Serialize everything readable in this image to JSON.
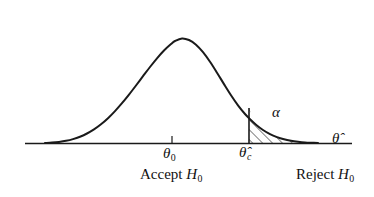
{
  "figure": {
    "name": "hypothesis-test-normal-curve",
    "background_color": "#ffffff",
    "ink_color": "#111111"
  },
  "labels": {
    "theta_null": "θ",
    "theta_null_sub": "0",
    "theta_crit": "θ̂",
    "theta_crit_sub": "c",
    "axis": "θ̂",
    "alpha": "α",
    "accept_text": "Accept ",
    "accept_h": "H",
    "accept_sub": "0",
    "reject_text": "Reject ",
    "reject_h": "H",
    "reject_sub": "0"
  },
  "chart_data": {
    "type": "line",
    "title": "",
    "subtitle": "",
    "xlabel": "θ̂",
    "ylabel": "",
    "grid": false,
    "legend": false,
    "axis_range_px": [
      25,
      355
    ],
    "baseline_y_px": 143,
    "peak_x_px": 175,
    "peak_y_px": 20,
    "curve_left_merge_px": 45,
    "curve_right_merge_px": 318,
    "critical_x_px": 249,
    "critical_curve_y_px": 108,
    "tick_x_px": 172,
    "annotations": [
      {
        "name": "theta-null-tick",
        "x_px": 172,
        "label": "θ₀"
      },
      {
        "name": "critical-value-line",
        "x_px": 249,
        "label": "θ̂_c"
      },
      {
        "name": "alpha-region",
        "label": "α",
        "x_px": 278,
        "y_px": 114
      }
    ],
    "regions": [
      {
        "name": "accept-region",
        "label": "Accept H0",
        "from_px": 25,
        "to_px": 249
      },
      {
        "name": "reject-region",
        "label": "Reject H0",
        "from_px": 249,
        "to_px": 355,
        "hatched": true
      }
    ],
    "curve_points": [
      {
        "x": 45,
        "y": 143.0
      },
      {
        "x": 52,
        "y": 142.6
      },
      {
        "x": 59,
        "y": 141.9
      },
      {
        "x": 66,
        "y": 140.8
      },
      {
        "x": 73,
        "y": 139.1
      },
      {
        "x": 80,
        "y": 136.7
      },
      {
        "x": 87,
        "y": 133.5
      },
      {
        "x": 94,
        "y": 129.4
      },
      {
        "x": 101,
        "y": 124.3
      },
      {
        "x": 108,
        "y": 118.2
      },
      {
        "x": 115,
        "y": 111.1
      },
      {
        "x": 122,
        "y": 103.2
      },
      {
        "x": 129,
        "y": 94.6
      },
      {
        "x": 136,
        "y": 85.5
      },
      {
        "x": 143,
        "y": 76.2
      },
      {
        "x": 150,
        "y": 67.0
      },
      {
        "x": 157,
        "y": 58.3
      },
      {
        "x": 164,
        "y": 50.5
      },
      {
        "x": 171,
        "y": 44.0
      },
      {
        "x": 175,
        "y": 41.0
      },
      {
        "x": 182,
        "y": 38.4
      },
      {
        "x": 189,
        "y": 40.0
      },
      {
        "x": 196,
        "y": 44.7
      },
      {
        "x": 203,
        "y": 52.2
      },
      {
        "x": 210,
        "y": 61.8
      },
      {
        "x": 217,
        "y": 72.7
      },
      {
        "x": 224,
        "y": 84.1
      },
      {
        "x": 231,
        "y": 95.2
      },
      {
        "x": 238,
        "y": 105.3
      },
      {
        "x": 245,
        "y": 114.0
      },
      {
        "x": 249,
        "y": 118.2
      },
      {
        "x": 256,
        "y": 124.7
      },
      {
        "x": 263,
        "y": 130.0
      },
      {
        "x": 270,
        "y": 134.1
      },
      {
        "x": 277,
        "y": 137.1
      },
      {
        "x": 284,
        "y": 139.3
      },
      {
        "x": 291,
        "y": 140.8
      },
      {
        "x": 298,
        "y": 141.8
      },
      {
        "x": 305,
        "y": 142.5
      },
      {
        "x": 312,
        "y": 142.8
      },
      {
        "x": 318,
        "y": 143.0
      }
    ]
  }
}
